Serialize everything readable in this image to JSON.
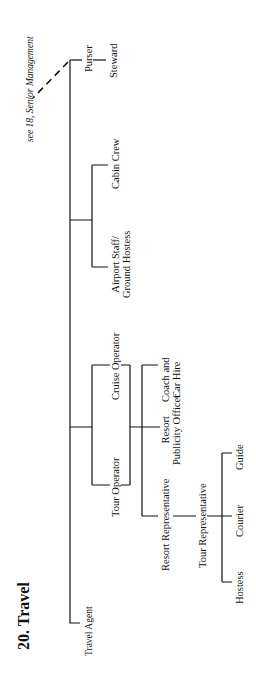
{
  "title": "20.  Travel",
  "see_also": "see 18, Senior Management",
  "nodes": {
    "travel_agent": "Travel Agent",
    "tour_operator": "Tour Operator",
    "cruise_operator": "Cruise Operator",
    "resort_representative": "Resort Representative",
    "resort_publicity_officer_1": "Resort",
    "resort_publicity_officer_2": "Publicity Officer",
    "coach_car_hire_1": "Coach and",
    "coach_car_hire_2": "Car Hire",
    "tour_representative": "Tour Representative",
    "hostess": "Hostess",
    "courier": "Courier",
    "guide": "Guide",
    "airport_staff_1": "Airport Staff/",
    "airport_staff_2": "Ground Hostess",
    "cabin_crew": "Cabin Crew",
    "purser": "Purser",
    "steward": "Steward"
  },
  "colors": {
    "line": "#111111",
    "background": "#ffffff"
  }
}
